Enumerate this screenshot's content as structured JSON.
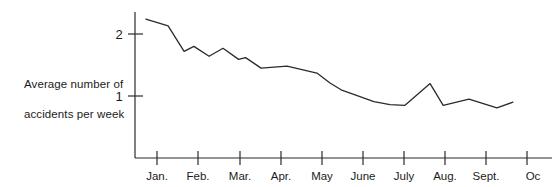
{
  "axis_label": {
    "line1": "Average number of",
    "line2": "accidents per week"
  },
  "chart_data": {
    "type": "line",
    "title": "",
    "xlabel": "",
    "ylabel": "Average number of accidents per week",
    "categories": [
      "Jan.",
      "Feb.",
      "Mar.",
      "Apr.",
      "May",
      "June",
      "July",
      "Aug.",
      "Sept.",
      "Oc"
    ],
    "ytick_labels": [
      "1",
      "2"
    ],
    "ytick_values": [
      1,
      2
    ],
    "ylim": [
      0,
      2.4
    ],
    "xlim_labels": [
      "Jan.",
      "Oc"
    ],
    "grid": false,
    "legend": null,
    "line_color": "#2b2b2b",
    "axis_color": "#2b2b2b",
    "series": [
      {
        "name": "Average accidents per week",
        "x": [
          0.73,
          1.27,
          1.66,
          1.9,
          2.27,
          2.61,
          2.99,
          3.16,
          3.54,
          4.17,
          4.9,
          5.22,
          5.49,
          6.29,
          6.68,
          7.05,
          7.66,
          7.98,
          8.61,
          9.29,
          9.68
        ],
        "values": [
          2.24,
          2.13,
          1.72,
          1.8,
          1.64,
          1.77,
          1.59,
          1.62,
          1.45,
          1.48,
          1.37,
          1.21,
          1.1,
          0.91,
          0.86,
          0.85,
          1.2,
          0.85,
          0.95,
          0.81,
          0.9
        ]
      }
    ],
    "point_labels": [],
    "annotations": []
  }
}
